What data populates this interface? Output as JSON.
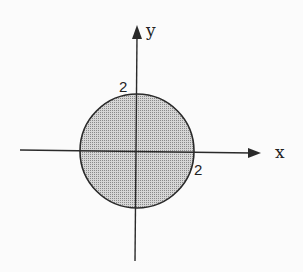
{
  "diagram": {
    "type": "coordinate-plane-region",
    "axes": {
      "x_label": "x",
      "y_label": "y"
    },
    "region": {
      "shape": "circle",
      "center": [
        0,
        0
      ],
      "radius": 2,
      "fill": "shaded"
    },
    "tick_labels": {
      "y_intercept": "2",
      "x_intercept": "2"
    },
    "colors": {
      "stroke": "#2a2a2a",
      "fill": "#bdbdbd",
      "background": "#fbfbfb"
    }
  }
}
